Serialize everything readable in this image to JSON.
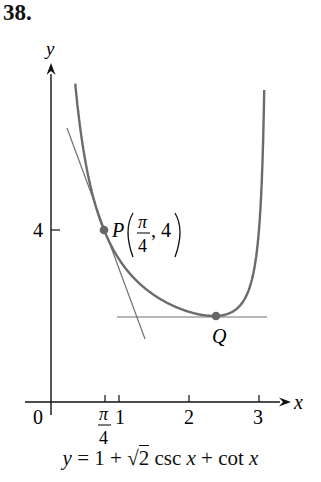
{
  "problem_number": "38.",
  "chart_data": {
    "type": "line",
    "title": "",
    "equation": "y = 1 + √2 csc x + cot x",
    "xlabel": "x",
    "ylabel": "y",
    "xlim": [
      0,
      3.1
    ],
    "ylim": [
      0,
      7.5
    ],
    "x_ticks": [
      {
        "value": 0.7854,
        "label": "π/4"
      },
      {
        "value": 1,
        "label": "1"
      },
      {
        "value": 2,
        "label": "2"
      },
      {
        "value": 3,
        "label": "3"
      }
    ],
    "y_ticks": [
      {
        "value": 4,
        "label": "4"
      }
    ],
    "origin_label": "0",
    "grid": false,
    "series": [
      {
        "name": "y = 1 + √2 csc x + cot x",
        "function": "1 + sqrt(2)/sin(x) + cos(x)/sin(x)",
        "x_range": [
          0.4,
          3.1
        ]
      },
      {
        "name": "tangent at P",
        "point": [
          0.7854,
          4
        ],
        "slope": -7.83
      },
      {
        "name": "tangent at Q",
        "point": [
          2.356,
          2
        ],
        "slope": 0
      }
    ],
    "points": [
      {
        "name": "P",
        "label": "P(π/4, 4)",
        "x": 0.7854,
        "y": 4
      },
      {
        "name": "Q",
        "label": "Q",
        "x": 2.3562,
        "y": 2
      }
    ]
  },
  "labels": {
    "y_axis": "y",
    "x_axis": "x",
    "origin": "0",
    "y_tick_4": "4",
    "x_tick_pi_num": "π",
    "x_tick_pi_den": "4",
    "x_tick_1": "1",
    "x_tick_2": "2",
    "x_tick_3": "3",
    "point_p_letter": "P",
    "point_p_num": "π",
    "point_p_den": "4",
    "point_p_y": ", 4",
    "point_q": "Q",
    "caption_y": "y",
    "caption_eq": " = 1 + ",
    "caption_sqrt": "2",
    "caption_csc": " csc ",
    "caption_x1": "x",
    "caption_plus": " + cot ",
    "caption_x2": "x"
  },
  "colors": {
    "curve": "#6b6b6b",
    "tangent": "#707070",
    "axis": "#111111",
    "point": "#666666"
  }
}
